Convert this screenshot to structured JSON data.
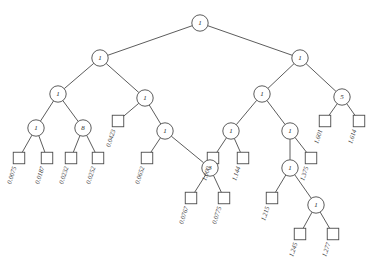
{
  "figure": {
    "type": "binary-tree-diagram",
    "background_color": "#ffffff",
    "stroke_color": "#4a4a4a",
    "text_color": "#2b2b2b",
    "width": 376,
    "height": 273,
    "label_rotation_deg": -72
  },
  "internal_nodes": [
    {
      "id": "n0",
      "label": "1",
      "x": 200,
      "y": 23
    },
    {
      "id": "n1",
      "label": "1",
      "x": 100,
      "y": 58
    },
    {
      "id": "n2",
      "label": "1",
      "x": 300,
      "y": 58
    },
    {
      "id": "n3",
      "label": "1",
      "x": 58,
      "y": 94
    },
    {
      "id": "n4",
      "label": "1",
      "x": 145,
      "y": 98
    },
    {
      "id": "n5",
      "label": "1",
      "x": 262,
      "y": 94
    },
    {
      "id": "n6",
      "label": "5",
      "x": 342,
      "y": 97
    },
    {
      "id": "n7",
      "label": "1",
      "x": 36,
      "y": 128
    },
    {
      "id": "n8",
      "label": "8",
      "x": 83,
      "y": 128
    },
    {
      "id": "n9",
      "label": "1",
      "x": 165,
      "y": 131
    },
    {
      "id": "n10",
      "label": "1",
      "x": 231,
      "y": 131
    },
    {
      "id": "n11",
      "label": "1",
      "x": 290,
      "y": 131
    },
    {
      "id": "n12",
      "label": "3",
      "x": 210,
      "y": 168
    },
    {
      "id": "n13",
      "label": "1",
      "x": 290,
      "y": 168
    },
    {
      "id": "n14",
      "label": "1",
      "x": 316,
      "y": 205
    }
  ],
  "leaf_nodes": [
    {
      "id": "l1",
      "label": "0.0075",
      "x": 19,
      "y": 158
    },
    {
      "id": "l2",
      "label": "0.0187",
      "x": 47,
      "y": 158
    },
    {
      "id": "l3",
      "label": "0.0232",
      "x": 71,
      "y": 158
    },
    {
      "id": "l4",
      "label": "0.0252",
      "x": 98,
      "y": 158
    },
    {
      "id": "l5",
      "label": "0.0423",
      "x": 118,
      "y": 121
    },
    {
      "id": "l6",
      "label": "0.0652",
      "x": 147,
      "y": 158
    },
    {
      "id": "l7",
      "label": "0.0767",
      "x": 191,
      "y": 198
    },
    {
      "id": "l8",
      "label": "0.0775",
      "x": 224,
      "y": 198
    },
    {
      "id": "l9",
      "label": "1.000",
      "x": 213,
      "y": 158
    },
    {
      "id": "l10",
      "label": "1.144",
      "x": 243,
      "y": 158
    },
    {
      "id": "l11",
      "label": "1.215",
      "x": 272,
      "y": 198
    },
    {
      "id": "l12",
      "label": "1.375",
      "x": 311,
      "y": 158
    },
    {
      "id": "l13",
      "label": "1.245",
      "x": 300,
      "y": 234
    },
    {
      "id": "l14",
      "label": "1.277",
      "x": 333,
      "y": 234
    },
    {
      "id": "l15",
      "label": "1.601",
      "x": 325,
      "y": 121
    },
    {
      "id": "l16",
      "label": "1.614",
      "x": 359,
      "y": 121
    }
  ],
  "edges": [
    {
      "from": "n0",
      "to": "n1"
    },
    {
      "from": "n0",
      "to": "n2"
    },
    {
      "from": "n1",
      "to": "n3"
    },
    {
      "from": "n1",
      "to": "n4"
    },
    {
      "from": "n2",
      "to": "n5"
    },
    {
      "from": "n2",
      "to": "n6"
    },
    {
      "from": "n3",
      "to": "n7"
    },
    {
      "from": "n3",
      "to": "n8"
    },
    {
      "from": "n4",
      "to": "l5"
    },
    {
      "from": "n4",
      "to": "n9"
    },
    {
      "from": "n5",
      "to": "n10"
    },
    {
      "from": "n5",
      "to": "n11"
    },
    {
      "from": "n6",
      "to": "l15"
    },
    {
      "from": "n6",
      "to": "l16"
    },
    {
      "from": "n7",
      "to": "l1"
    },
    {
      "from": "n7",
      "to": "l2"
    },
    {
      "from": "n8",
      "to": "l3"
    },
    {
      "from": "n8",
      "to": "l4"
    },
    {
      "from": "n9",
      "to": "l6"
    },
    {
      "from": "n9",
      "to": "n12"
    },
    {
      "from": "n10",
      "to": "l9"
    },
    {
      "from": "n10",
      "to": "l10"
    },
    {
      "from": "n11",
      "to": "n13"
    },
    {
      "from": "n11",
      "to": "l12"
    },
    {
      "from": "n12",
      "to": "l7"
    },
    {
      "from": "n12",
      "to": "l8"
    },
    {
      "from": "n13",
      "to": "l11"
    },
    {
      "from": "n13",
      "to": "n14"
    },
    {
      "from": "n14",
      "to": "l13"
    },
    {
      "from": "n14",
      "to": "l14"
    }
  ]
}
